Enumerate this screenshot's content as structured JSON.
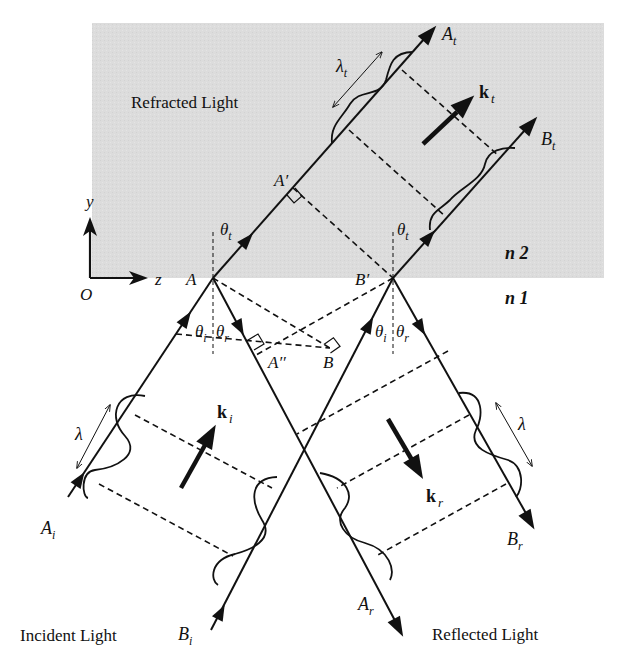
{
  "figure": {
    "regions": {
      "upper_medium_label": "n 2",
      "lower_medium_label": "n 1",
      "upper_fill": "#dcdcdc"
    },
    "captions": {
      "refracted": "Refracted Light",
      "incident": "Incident Light",
      "reflected": "Reflected Light"
    },
    "axes": {
      "origin": "O",
      "x_axis": "z",
      "y_axis": "y"
    },
    "points": {
      "A": "A",
      "B_prime": "B′",
      "A_prime": "A′",
      "A_double_prime": "A′′",
      "B": "B"
    },
    "ray_labels": {
      "A_i": {
        "main": "A",
        "sub": "i"
      },
      "B_i": {
        "main": "B",
        "sub": "i"
      },
      "A_r": {
        "main": "A",
        "sub": "r"
      },
      "B_r": {
        "main": "B",
        "sub": "r"
      },
      "A_t": {
        "main": "A",
        "sub": "t"
      },
      "B_t": {
        "main": "B",
        "sub": "t"
      }
    },
    "wave_vectors": {
      "k_i": {
        "main": "k",
        "sub": "i"
      },
      "k_r": {
        "main": "k",
        "sub": "r"
      },
      "k_t": {
        "main": "k",
        "sub": "t"
      }
    },
    "angles": {
      "theta_i": {
        "main": "θ",
        "sub": "i"
      },
      "theta_r": {
        "main": "θ",
        "sub": "r"
      },
      "theta_t": {
        "main": "θ",
        "sub": "t"
      }
    },
    "wavelengths": {
      "incident": "λ",
      "reflected": "λ",
      "transmitted": {
        "main": "λ",
        "sub": "t"
      }
    }
  }
}
